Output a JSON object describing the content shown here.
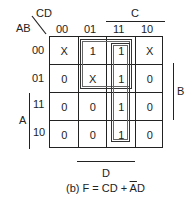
{
  "kmap": {
    "row_var": "AB",
    "col_var": "CD",
    "col_headers": [
      "00",
      "01",
      "11",
      "10"
    ],
    "row_headers": [
      "00",
      "01",
      "11",
      "10"
    ],
    "cells": [
      [
        "X",
        "1",
        "1",
        "X"
      ],
      [
        "0",
        "X",
        "1",
        "0"
      ],
      [
        "0",
        "0",
        "1",
        "0"
      ],
      [
        "0",
        "0",
        "1",
        "0"
      ]
    ],
    "labels": {
      "C": "C",
      "D": "D",
      "A": "A",
      "B": "B"
    },
    "groups": [
      {
        "name": "CD",
        "rows": [
          0,
          3
        ],
        "cols": [
          2,
          2
        ]
      },
      {
        "name": "A'D",
        "rows": [
          0,
          1
        ],
        "cols": [
          1,
          2
        ]
      }
    ]
  },
  "caption": {
    "prefix": "(b) F = CD + ",
    "abar": "A",
    "suffix": "D"
  }
}
